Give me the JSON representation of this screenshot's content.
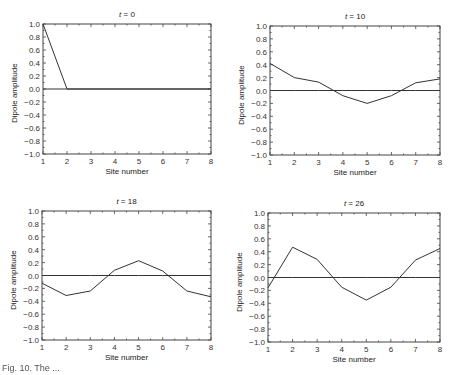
{
  "figure": {
    "caption": "Fig. 10. The ..."
  },
  "chart_data": [
    {
      "type": "line",
      "title": "t = 0",
      "title_var": "t",
      "title_value": "0",
      "xlabel": "Site number",
      "ylabel": "Dipole amplitude",
      "x": [
        1,
        2,
        3,
        4,
        5,
        6,
        7,
        8
      ],
      "xticks": [
        "1",
        "2",
        "3",
        "4",
        "5",
        "6",
        "7",
        "8"
      ],
      "yticks": [
        "1.0",
        "0.8",
        "0.6",
        "0.4",
        "0.2",
        "0.0",
        "-0.2",
        "-0.4",
        "-0.6",
        "-0.8",
        "-1.0"
      ],
      "xlim": [
        1,
        8
      ],
      "ylim": [
        -1.0,
        1.0
      ],
      "grid": false,
      "series": [
        {
          "name": "amplitude",
          "values": [
            1.0,
            0.0,
            0.0,
            0.0,
            0.0,
            0.0,
            0.0,
            0.0
          ]
        },
        {
          "name": "zero line",
          "values": [
            0.0,
            0.0,
            0.0,
            0.0,
            0.0,
            0.0,
            0.0,
            0.0
          ]
        }
      ]
    },
    {
      "type": "line",
      "title": "t = 10",
      "title_var": "t",
      "title_value": "10",
      "xlabel": "Site number",
      "ylabel": "Dipole amplitude",
      "x": [
        1,
        2,
        3,
        4,
        5,
        6,
        7,
        8
      ],
      "xticks": [
        "1",
        "2",
        "3",
        "4",
        "5",
        "6",
        "7",
        "8"
      ],
      "yticks": [
        "1.0",
        "0.8",
        "0.6",
        "0.4",
        "0.2",
        "0.0",
        "-0.2",
        "-0.4",
        "-0.6",
        "-0.8",
        "-1.0"
      ],
      "xlim": [
        1,
        8
      ],
      "ylim": [
        -1.0,
        1.0
      ],
      "grid": false,
      "series": [
        {
          "name": "amplitude",
          "values": [
            0.42,
            0.2,
            0.13,
            -0.08,
            -0.2,
            -0.08,
            0.12,
            0.18
          ]
        },
        {
          "name": "zero line",
          "values": [
            0.0,
            0.0,
            0.0,
            0.0,
            0.0,
            0.0,
            0.0,
            0.0
          ]
        }
      ]
    },
    {
      "type": "line",
      "title": "t = 18",
      "title_var": "t",
      "title_value": "18",
      "xlabel": "Site number",
      "ylabel": "Dipole amplitude",
      "x": [
        1,
        2,
        3,
        4,
        5,
        6,
        7,
        8
      ],
      "xticks": [
        "1",
        "2",
        "3",
        "4",
        "5",
        "6",
        "7",
        "8"
      ],
      "yticks": [
        "1.0",
        "0.8",
        "0.6",
        "0.4",
        "0.2",
        "0.0",
        "-0.2",
        "-0.4",
        "-0.6",
        "-0.8",
        "-1.0"
      ],
      "xlim": [
        1,
        8
      ],
      "ylim": [
        -1.0,
        1.0
      ],
      "grid": false,
      "series": [
        {
          "name": "amplitude",
          "values": [
            -0.12,
            -0.31,
            -0.24,
            0.08,
            0.23,
            0.07,
            -0.24,
            -0.33
          ]
        },
        {
          "name": "zero line",
          "values": [
            0.0,
            0.0,
            0.0,
            0.0,
            0.0,
            0.0,
            0.0,
            0.0
          ]
        }
      ]
    },
    {
      "type": "line",
      "title": "t = 26",
      "title_var": "t",
      "title_value": "26",
      "xlabel": "Site number",
      "ylabel": "Dipole amplitude",
      "x": [
        1,
        2,
        3,
        4,
        5,
        6,
        7,
        8
      ],
      "xticks": [
        "1",
        "2",
        "3",
        "4",
        "5",
        "6",
        "7",
        "8"
      ],
      "yticks": [
        "1.0",
        "0.8",
        "0.6",
        "0.4",
        "0.2",
        "0.0",
        "-0.2",
        "-0.4",
        "-0.6",
        "-0.8",
        "-1.0"
      ],
      "xlim": [
        1,
        8
      ],
      "ylim": [
        -1.0,
        1.0
      ],
      "grid": false,
      "series": [
        {
          "name": "amplitude",
          "values": [
            -0.16,
            0.47,
            0.28,
            -0.15,
            -0.35,
            -0.15,
            0.27,
            0.45
          ]
        },
        {
          "name": "zero line",
          "values": [
            0.0,
            0.0,
            0.0,
            0.0,
            0.0,
            0.0,
            0.0,
            0.0
          ]
        }
      ]
    }
  ],
  "layout": {
    "panels": [
      {
        "left": 43,
        "top": 24,
        "width": 168,
        "height": 130
      },
      {
        "left": 270,
        "top": 26,
        "width": 170,
        "height": 129
      },
      {
        "left": 42,
        "top": 211,
        "width": 169,
        "height": 129
      },
      {
        "left": 268,
        "top": 213,
        "width": 172,
        "height": 129
      }
    ],
    "line_color": "#333333",
    "axis_color": "#444444"
  }
}
